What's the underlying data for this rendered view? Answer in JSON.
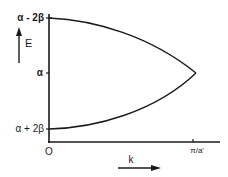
{
  "diagram": {
    "type": "band-structure",
    "y_axis": {
      "label": "E",
      "ticks": [
        {
          "label": "α - 2β",
          "position": "top"
        },
        {
          "label": "α",
          "position": "middle"
        },
        {
          "label": "α + 2β",
          "position": "bottom"
        }
      ]
    },
    "x_axis": {
      "label": "k",
      "ticks": [
        {
          "label": "O",
          "position": "origin"
        },
        {
          "label": "π/a'",
          "position": "end"
        }
      ]
    },
    "curves": [
      {
        "name": "upper-band",
        "from": "α - 2β at k=0",
        "to": "α at k=π/a'"
      },
      {
        "name": "lower-band",
        "from": "α + 2β at k=0",
        "to": "α at k=π/a'"
      }
    ],
    "colors": {
      "ink": "#1a1a1a",
      "background": "#ffffff"
    }
  }
}
